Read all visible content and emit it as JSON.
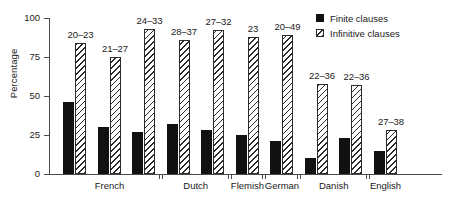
{
  "chart_data": {
    "type": "bar",
    "title": "",
    "xlabel": "",
    "ylabel": "Percentage",
    "ylim": [
      0,
      100
    ],
    "yticks": [
      0,
      25,
      50,
      75,
      100
    ],
    "ytick_labels": [
      "0",
      "25",
      "50",
      "75",
      "100"
    ],
    "grid": false,
    "legend_position": "top-right",
    "legend": [
      "Finite clauses",
      "Infinitive clauses"
    ],
    "groups": [
      {
        "label": "French",
        "pairs": 3
      },
      {
        "label": "Dutch",
        "pairs": 2
      },
      {
        "label": "Flemish",
        "pairs": 1
      },
      {
        "label": "German",
        "pairs": 1
      },
      {
        "label": "Danish",
        "pairs": 2
      },
      {
        "label": "English",
        "pairs": 1
      }
    ],
    "series": [
      {
        "name": "Finite clauses",
        "color": "#111111",
        "fill": "solid",
        "values": [
          46,
          30,
          27,
          32,
          28,
          25,
          21,
          10,
          23,
          15
        ]
      },
      {
        "name": "Infinitive clauses",
        "color": "#2b2b2b",
        "fill": "hatched",
        "values": [
          84,
          75,
          93,
          86,
          92,
          88,
          89,
          58,
          57,
          28
        ]
      }
    ],
    "annotations": [
      "20–23",
      "21–27",
      "24–33",
      "28–37",
      "27–32",
      "23",
      "20–49",
      "22–36",
      "22–36",
      "27–38"
    ]
  }
}
